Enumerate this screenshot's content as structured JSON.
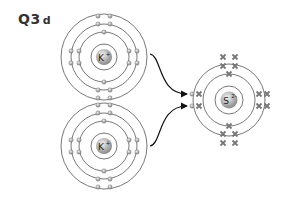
{
  "question": {
    "number": "Q3",
    "part": "d"
  },
  "atoms": [
    {
      "id": "potassium-1",
      "symbol": "K",
      "charge": "+",
      "cx": 104,
      "cy": 57,
      "rings": [
        13,
        25,
        33,
        43
      ]
    },
    {
      "id": "potassium-2",
      "symbol": "K",
      "charge": "+",
      "cx": 104,
      "cy": 146,
      "rings": [
        13,
        25,
        33,
        43
      ]
    },
    {
      "id": "sulfide",
      "symbol": "S",
      "charge": "2-",
      "cx": 229,
      "cy": 100,
      "rings": [
        14,
        26,
        36
      ]
    }
  ],
  "colors": {
    "ring": "#555555",
    "electron": "#999999",
    "nucleus": "#aaaaaa",
    "cross": "#777777",
    "arrow": "#111111"
  }
}
